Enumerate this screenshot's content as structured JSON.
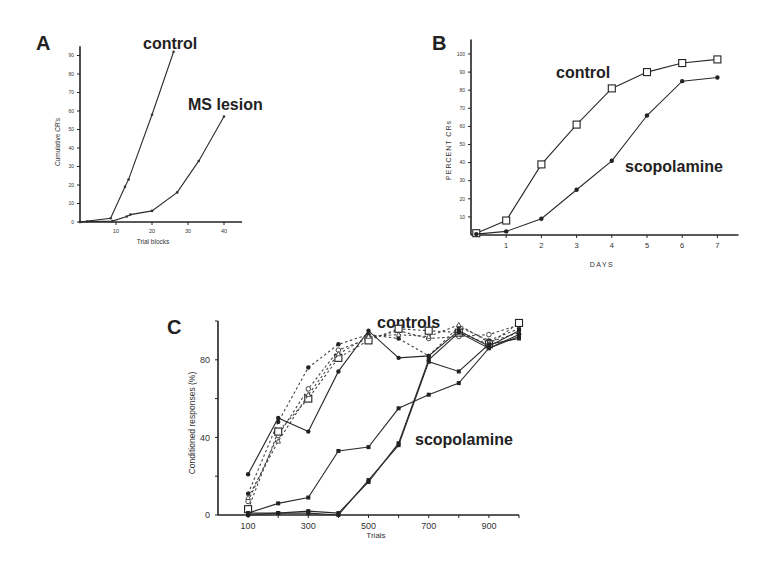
{
  "chart_data": [
    {
      "panel": "A",
      "type": "line",
      "title": "",
      "xlabel": "Trial blocks",
      "ylabel": "Cumulative CR's",
      "xlim": [
        0,
        45
      ],
      "ylim": [
        0,
        95
      ],
      "xticks": [
        10,
        20,
        30,
        40
      ],
      "yticks": [
        0,
        10,
        20,
        30,
        40,
        50,
        60,
        70,
        80,
        90
      ],
      "grid": false,
      "annotations": [
        {
          "text": "control",
          "x": 18.5,
          "y": 96
        },
        {
          "text": "MS lesion",
          "x": 30,
          "y": 63
        }
      ],
      "series": [
        {
          "name": "control",
          "style": "solid",
          "marker": "dot",
          "x": [
            0,
            8.5,
            12.5,
            13.5,
            20,
            26
          ],
          "y": [
            0,
            2,
            19,
            23,
            58,
            92
          ]
        },
        {
          "name": "MS lesion",
          "style": "solid",
          "marker": "dot",
          "x": [
            0,
            2,
            9,
            13,
            14,
            20,
            27,
            33,
            40
          ],
          "y": [
            0,
            0.3,
            0.5,
            3,
            4,
            6,
            16,
            33,
            57
          ]
        }
      ]
    },
    {
      "panel": "B",
      "type": "line",
      "title": "",
      "xlabel": "DAYS",
      "ylabel": "PERCENT CRs",
      "xlim": [
        0,
        7.6
      ],
      "ylim": [
        0,
        105
      ],
      "xticks": [
        1,
        2,
        3,
        4,
        5,
        6,
        7
      ],
      "yticks": [
        10,
        20,
        30,
        40,
        50,
        60,
        70,
        80,
        90,
        100
      ],
      "grid": false,
      "annotations": [
        {
          "text": "control",
          "x": 2.4,
          "y": 88
        },
        {
          "text": "scopolamine",
          "x": 4.4,
          "y": 36
        }
      ],
      "series": [
        {
          "name": "control",
          "style": "solid",
          "marker": "open-square",
          "x": [
            0.15,
            1,
            2,
            3,
            4,
            5,
            6,
            7
          ],
          "y": [
            1,
            8,
            39,
            61,
            81,
            90,
            95,
            97
          ]
        },
        {
          "name": "scopolamine",
          "style": "solid",
          "marker": "filled-dot",
          "x": [
            0.15,
            1,
            2,
            3,
            4,
            5,
            6,
            7
          ],
          "y": [
            0.5,
            2,
            9,
            25,
            41,
            66,
            85,
            87
          ]
        }
      ]
    },
    {
      "panel": "C",
      "type": "line",
      "title": "",
      "xlabel": "Trials",
      "ylabel": "Conditioned responses (%)",
      "xlim": [
        0,
        1000
      ],
      "ylim": [
        0,
        100
      ],
      "xticks": [
        100,
        300,
        500,
        700,
        900
      ],
      "xminor": [
        200,
        400,
        600,
        800,
        1000
      ],
      "yticks": [
        0,
        40,
        80
      ],
      "yminor": [
        20,
        60,
        100
      ],
      "grid": false,
      "annotations": [
        {
          "text": "controls",
          "x": 590,
          "y": 103
        },
        {
          "text": "scopolamine",
          "x": 710,
          "y": 36
        }
      ],
      "series": [
        {
          "name": "control 1",
          "group": "controls",
          "style": "dashed",
          "marker": "filled-dot",
          "x": [
            100,
            200,
            300,
            400,
            500,
            600,
            700,
            800,
            900,
            1000
          ],
          "y": [
            11,
            48,
            76,
            88,
            93,
            91,
            82,
            97,
            90,
            96
          ]
        },
        {
          "name": "control 2",
          "group": "controls",
          "style": "dashed",
          "marker": "open-circle",
          "x": [
            100,
            200,
            300,
            400,
            500,
            600,
            700,
            800,
            900,
            1000
          ],
          "y": [
            7,
            41,
            65,
            85,
            91,
            95,
            91,
            92,
            93,
            98
          ]
        },
        {
          "name": "control 3",
          "group": "controls",
          "style": "dashed",
          "marker": "open-square",
          "x": [
            100,
            200,
            300,
            400,
            500,
            600,
            700,
            800,
            900,
            1000
          ],
          "y": [
            3,
            43,
            60,
            81,
            90,
            96,
            95,
            94,
            88,
            99
          ]
        },
        {
          "name": "control 4",
          "group": "controls",
          "style": "dashed",
          "marker": "triangle",
          "x": [
            100,
            200,
            300,
            400,
            500,
            600,
            700,
            800,
            900,
            1000
          ],
          "y": [
            9,
            38,
            62,
            83,
            92,
            93,
            92,
            98,
            89,
            94
          ]
        },
        {
          "name": "scopolamine 1",
          "group": "scopolamine",
          "style": "solid",
          "marker": "filled-dot",
          "x": [
            100,
            200,
            300,
            400,
            500,
            600,
            700,
            800,
            900,
            1000
          ],
          "y": [
            21,
            50,
            43,
            74,
            95,
            81,
            82,
            95,
            87,
            95
          ]
        },
        {
          "name": "scopolamine 2",
          "group": "scopolamine",
          "style": "solid",
          "marker": "filled-square",
          "x": [
            100,
            200,
            300,
            400,
            500,
            600,
            700,
            800,
            900,
            1000
          ],
          "y": [
            1,
            6,
            9,
            33,
            35,
            55,
            62,
            68,
            86,
            92
          ]
        },
        {
          "name": "scopolamine 3",
          "group": "scopolamine",
          "style": "solid",
          "marker": "filled-square",
          "x": [
            100,
            200,
            300,
            400,
            500,
            600,
            700,
            800,
            900,
            1000
          ],
          "y": [
            1,
            1,
            1,
            0,
            18,
            36,
            79,
            74,
            88,
            91
          ]
        },
        {
          "name": "scopolamine 4",
          "group": "scopolamine",
          "style": "solid",
          "marker": "filled-square",
          "x": [
            100,
            200,
            300,
            400,
            500,
            600,
            700,
            800,
            900,
            1000
          ],
          "y": [
            0,
            1,
            2,
            1,
            17,
            37,
            80,
            94,
            86,
            93
          ]
        }
      ]
    }
  ],
  "panels": {
    "A": {
      "letter": "A",
      "ylabel": "Cumulative CR's",
      "xlabel": "Trial blocks",
      "label_control": "control",
      "label_lesion": "MS lesion"
    },
    "B": {
      "letter": "B",
      "ylabel": "PERCENT CRs",
      "xlabel": "DAYS",
      "label_control": "control",
      "label_drug": "scopolamine"
    },
    "C": {
      "letter": "C",
      "ylabel": "Conditioned responses (%)",
      "xlabel": "Trials",
      "label_control": "controls",
      "label_drug": "scopolamine"
    }
  },
  "layout": {
    "A": {
      "x0": 80,
      "y0": 222,
      "xpx": 3.6,
      "ypx": 1.85,
      "xmax": 45,
      "ymax": 95
    },
    "B": {
      "x0": 471,
      "y0": 235,
      "xpx": 35.2,
      "ypx": 1.81,
      "xmax": 7.6,
      "ymax": 108
    },
    "C": {
      "x0": 218,
      "y0": 515,
      "xpx": 0.301,
      "ypx": 1.94,
      "xmax": 1000,
      "ymax": 100
    }
  }
}
